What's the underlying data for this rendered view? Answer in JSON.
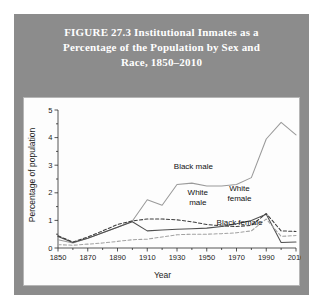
{
  "figure": {
    "title_lines": [
      "FIGURE 27.3    Institutional Inmates as a",
      "Percentage of the Population by Sex and",
      "Race, 1850–2010"
    ],
    "header_color": "#8c8c8c",
    "panel_color": "#fdfdfd"
  },
  "chart_data": {
    "type": "line",
    "title": "FIGURE 27.3 Institutional Inmates as a Percentage of the Population by Sex and Race, 1850–2010",
    "xlabel": "Year",
    "ylabel": "Percentage of population",
    "xlim": [
      1850,
      2010
    ],
    "ylim": [
      0,
      5
    ],
    "xticks": [
      1850,
      1870,
      1890,
      1910,
      1930,
      1950,
      1970,
      1990,
      2010
    ],
    "xtick_labels": [
      "1850",
      "1870",
      "1890",
      "1910",
      "1930",
      "1950",
      "1970",
      "1990",
      "2010"
    ],
    "yticks": [
      0,
      1,
      2,
      3,
      4,
      5
    ],
    "ytick_labels": [
      "0",
      "1",
      "2",
      "3",
      "4",
      "5"
    ],
    "minor_xtick_step": 10,
    "minor_ytick_step": 0.5,
    "grid": false,
    "legend": "inline-annotations",
    "x": [
      1850,
      1860,
      1870,
      1880,
      1890,
      1900,
      1910,
      1920,
      1930,
      1940,
      1950,
      1960,
      1970,
      1980,
      1990,
      2000,
      2010
    ],
    "series": [
      {
        "name": "Black male",
        "style": "solid",
        "color": "#9a9a9a",
        "values": [
          0.3,
          0.18,
          0.35,
          0.55,
          0.75,
          0.98,
          1.75,
          1.55,
          2.3,
          2.35,
          2.25,
          2.25,
          2.3,
          2.55,
          3.95,
          4.55,
          4.1
        ]
      },
      {
        "name": "White male",
        "style": "solid",
        "color": "#4f4f4f",
        "values": [
          0.42,
          0.2,
          0.35,
          0.55,
          0.75,
          0.95,
          0.62,
          0.65,
          0.68,
          0.7,
          0.72,
          0.78,
          0.88,
          1.0,
          1.22,
          0.2,
          0.22
        ]
      },
      {
        "name": "White female",
        "style": "dashed",
        "color": "#3d3d3d",
        "values": [
          0.44,
          0.22,
          0.4,
          0.62,
          0.85,
          0.98,
          1.05,
          1.05,
          1.02,
          0.95,
          0.85,
          0.8,
          0.78,
          0.82,
          1.25,
          0.62,
          0.6
        ]
      },
      {
        "name": "Black female",
        "style": "dashed",
        "color": "#a2a2a2",
        "values": [
          0.12,
          0.1,
          0.14,
          0.18,
          0.24,
          0.3,
          0.32,
          0.4,
          0.48,
          0.5,
          0.5,
          0.52,
          0.55,
          0.62,
          1.05,
          0.42,
          0.45
        ]
      }
    ],
    "annotations": [
      {
        "text": "Black male",
        "x": 1941,
        "y": 2.95
      },
      {
        "text": "White male",
        "x": 1944,
        "y": 1.98
      },
      {
        "text": "White female",
        "x": 1972,
        "y": 2.12
      },
      {
        "text": "Black female",
        "x": 1972,
        "y": 0.92
      }
    ]
  }
}
